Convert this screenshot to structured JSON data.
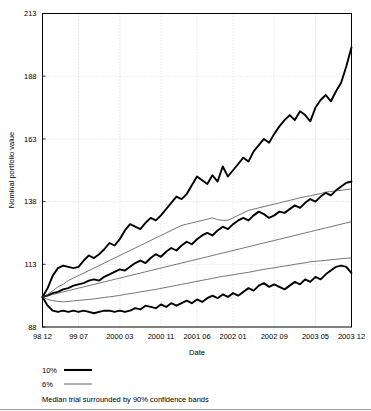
{
  "chart_data": {
    "type": "line",
    "title": "",
    "xlabel": "Date",
    "ylabel": "Nominal portfolio value",
    "grid": true,
    "legend_position": "below-plot",
    "ylim": [
      88,
      213
    ],
    "yticks": [
      88,
      113,
      138,
      163,
      188,
      213
    ],
    "ytick_labels": [
      "88",
      "113",
      "138",
      "163",
      "188",
      "213"
    ],
    "xtick_labels": [
      "98 12",
      "99 07",
      "2000 03",
      "2000 11",
      "2001 06",
      "2002 01",
      "2002 09",
      "2003 05",
      "2003 12"
    ],
    "xtick_positions": [
      0,
      7,
      15,
      23,
      30,
      37,
      45,
      53,
      60
    ],
    "x_index_range": [
      0,
      60
    ],
    "legend": [
      {
        "label": "10%",
        "style": "thick"
      },
      {
        "label": "6%",
        "style": "thin"
      }
    ],
    "caption": "Median trial surrounded by 90% confidence bands",
    "colors": {
      "series": "#000000",
      "series_thin": "#3a3a3a",
      "grid": "#bdbdbd",
      "frame": "#000000",
      "background": "#ffffff"
    },
    "series": [
      {
        "name": "10% upper confidence band",
        "style": "thick",
        "values": [
          100,
          103.5,
          108.5,
          111.5,
          112.5,
          112.0,
          111.5,
          112.0,
          114.5,
          116.5,
          115.5,
          117.0,
          119.0,
          121.5,
          120.5,
          123.0,
          126.5,
          129.0,
          128.0,
          127.0,
          129.5,
          131.5,
          130.5,
          132.5,
          135.0,
          137.5,
          140.0,
          139.0,
          141.0,
          144.5,
          148.0,
          146.5,
          145.0,
          148.5,
          146.0,
          152.0,
          148.0,
          150.5,
          153.0,
          155.5,
          154.0,
          158.0,
          160.5,
          163.0,
          161.5,
          165.0,
          168.0,
          170.5,
          172.5,
          170.5,
          174.0,
          172.5,
          170.0,
          175.5,
          178.5,
          180.5,
          178.0,
          182.0,
          185.5,
          192.0,
          199.5
        ]
      },
      {
        "name": "10% median",
        "style": "thick",
        "values": [
          100,
          100.5,
          101.5,
          102.0,
          103.0,
          103.5,
          104.5,
          105.0,
          105.5,
          106.5,
          107.0,
          106.5,
          108.0,
          109.0,
          110.0,
          111.0,
          110.5,
          112.0,
          113.5,
          114.5,
          113.5,
          115.5,
          117.0,
          116.0,
          118.0,
          119.5,
          118.5,
          120.5,
          122.0,
          121.0,
          123.0,
          124.5,
          125.5,
          124.5,
          126.5,
          128.0,
          127.0,
          129.0,
          130.5,
          131.5,
          130.5,
          132.5,
          134.0,
          133.0,
          131.5,
          132.5,
          134.0,
          133.5,
          135.0,
          136.5,
          135.5,
          137.5,
          139.0,
          138.0,
          140.0,
          141.5,
          140.5,
          142.5,
          144.0,
          145.5,
          146.0
        ]
      },
      {
        "name": "10% lower confidence band",
        "style": "thick",
        "values": [
          100,
          96.5,
          94.5,
          94.0,
          94.5,
          94.0,
          94.5,
          94.0,
          94.5,
          94.0,
          93.5,
          94.0,
          94.5,
          94.5,
          94.0,
          94.5,
          94.0,
          94.5,
          95.5,
          95.0,
          96.5,
          96.0,
          95.5,
          97.0,
          96.0,
          97.5,
          96.5,
          97.5,
          98.5,
          97.5,
          99.0,
          98.0,
          99.5,
          100.5,
          99.5,
          101.0,
          100.0,
          101.5,
          100.5,
          102.0,
          103.5,
          102.5,
          104.5,
          105.5,
          104.0,
          105.0,
          104.0,
          103.0,
          104.5,
          106.0,
          105.0,
          107.0,
          106.0,
          108.0,
          107.0,
          109.0,
          110.5,
          112.0,
          112.5,
          112.0,
          109.5
        ]
      },
      {
        "name": "6% upper confidence band",
        "style": "thin",
        "values": [
          100,
          101.0,
          102.5,
          104.0,
          105.0,
          106.5,
          107.5,
          108.5,
          109.5,
          110.5,
          111.5,
          112.5,
          113.5,
          114.5,
          115.5,
          116.5,
          117.5,
          118.5,
          119.5,
          120.5,
          121.5,
          122.5,
          123.5,
          124.5,
          125.5,
          126.5,
          127.5,
          128.5,
          129.0,
          129.5,
          130.0,
          130.5,
          131.0,
          131.5,
          130.8,
          130.5,
          130.6,
          131.5,
          132.5,
          133.5,
          134.5,
          135.0,
          135.5,
          136.0,
          136.5,
          137.0,
          137.5,
          138.0,
          138.5,
          139.0,
          139.5,
          140.0,
          140.3,
          140.8,
          141.2,
          141.8,
          142.0,
          142.3,
          142.5,
          142.8,
          143.0
        ]
      },
      {
        "name": "6% median",
        "style": "thin",
        "values": [
          100,
          100.5,
          101.0,
          101.5,
          102.0,
          102.5,
          103.0,
          103.5,
          104.0,
          104.5,
          105.0,
          105.5,
          106.0,
          106.5,
          107.0,
          107.5,
          108.0,
          108.5,
          109.0,
          109.5,
          110.0,
          110.5,
          111.0,
          111.5,
          112.0,
          112.5,
          113.0,
          113.5,
          114.0,
          114.5,
          115.0,
          115.5,
          116.0,
          116.5,
          117.0,
          117.5,
          118.0,
          118.5,
          119.0,
          119.5,
          120.0,
          120.5,
          121.0,
          121.5,
          122.0,
          122.5,
          123.0,
          123.5,
          124.0,
          124.5,
          125.0,
          125.5,
          126.0,
          126.5,
          127.0,
          127.5,
          128.0,
          128.5,
          129.0,
          129.5,
          130.0
        ]
      },
      {
        "name": "6% lower confidence band",
        "style": "thin",
        "values": [
          100,
          99.0,
          98.5,
          98.2,
          98.0,
          98.2,
          98.4,
          98.6,
          98.8,
          99.0,
          99.2,
          99.5,
          99.8,
          100.0,
          100.3,
          100.6,
          101.0,
          101.3,
          101.6,
          102.0,
          102.3,
          102.7,
          103.0,
          103.4,
          103.8,
          104.2,
          104.6,
          105.0,
          105.4,
          105.8,
          106.2,
          106.6,
          107.0,
          107.4,
          107.8,
          108.2,
          108.5,
          108.8,
          109.2,
          109.5,
          109.8,
          110.2,
          110.6,
          111.0,
          111.3,
          111.6,
          112.0,
          112.3,
          112.6,
          113.0,
          113.3,
          113.6,
          114.0,
          114.2,
          114.4,
          114.6,
          114.8,
          115.0,
          115.2,
          115.4,
          115.5
        ]
      }
    ]
  }
}
